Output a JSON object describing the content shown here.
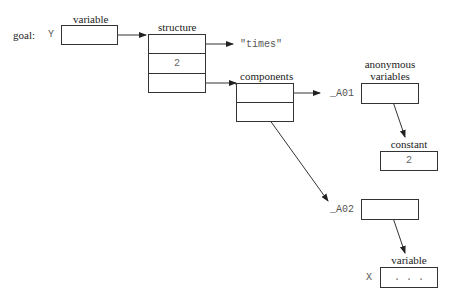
{
  "goal": {
    "label": "goal:",
    "var_name": "Y"
  },
  "variable_top": {
    "title": "variable"
  },
  "structure": {
    "title": "structure",
    "functor": "\"times\"",
    "arity": "2"
  },
  "components": {
    "title": "components"
  },
  "anonymous": {
    "title_line1": "anonymous",
    "title_line2": "variables",
    "a01": "_A01",
    "a02": "_A02"
  },
  "constant": {
    "title": "constant",
    "value": "2"
  },
  "variable_bottom": {
    "title": "variable",
    "var_name": "X",
    "value": ". . ."
  }
}
